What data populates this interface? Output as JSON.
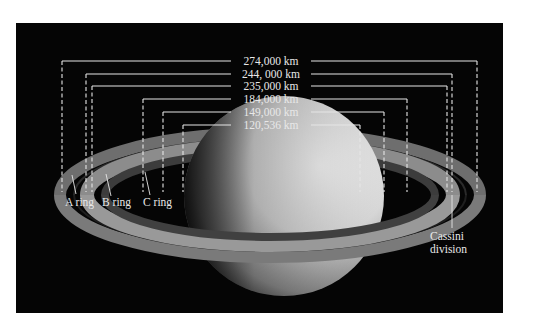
{
  "figure": {
    "background_color": "#050505",
    "line_color": "#e6e6e6"
  },
  "measurements": [
    {
      "label": "274,000 km",
      "y": 61,
      "left_x": 62,
      "right_x": 477
    },
    {
      "label": "244, 000 km",
      "y": 74,
      "left_x": 86,
      "right_x": 452
    },
    {
      "label": "235,000 km",
      "y": 86,
      "left_x": 92,
      "right_x": 447
    },
    {
      "label": "184,000 km",
      "y": 99,
      "left_x": 143,
      "right_x": 407
    },
    {
      "label": "149,000 km",
      "y": 112,
      "left_x": 163,
      "right_x": 384
    },
    {
      "label": "120,536 km",
      "y": 125,
      "left_x": 183,
      "right_x": 360
    }
  ],
  "ring_labels": {
    "a_ring": "A ring",
    "b_ring": "B ring",
    "c_ring": "C ring",
    "cassini_line1": "Cassini",
    "cassini_line2": "division"
  }
}
